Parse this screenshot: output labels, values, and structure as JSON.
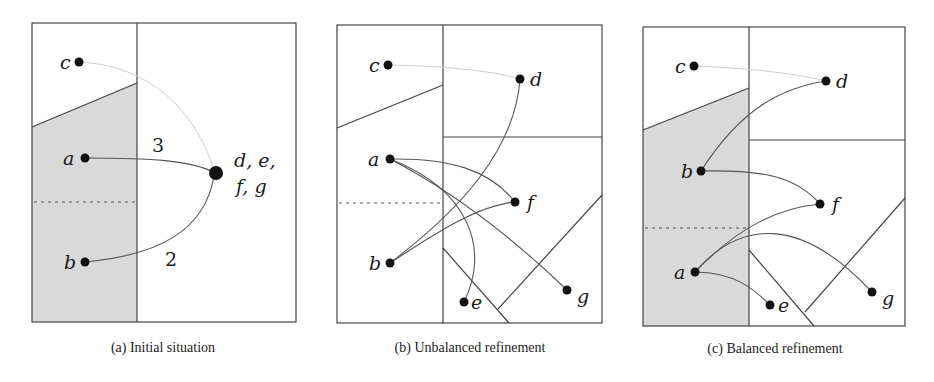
{
  "figure": {
    "panels": [
      {
        "id": "a",
        "caption": "(a)  Initial situation",
        "nodes": {
          "c": "c",
          "a": "a",
          "b": "b",
          "merged": "d, e,",
          "merged2": "f, g"
        },
        "edge_weights": {
          "a_to_merged": "3",
          "b_to_merged": "2"
        }
      },
      {
        "id": "b",
        "caption": "(b)  Unbalanced refinement",
        "nodes": {
          "c": "c",
          "d": "d",
          "a": "a",
          "f": "f",
          "b": "b",
          "e": "e",
          "g": "g"
        }
      },
      {
        "id": "c",
        "caption": "(c)  Balanced refinement",
        "nodes": {
          "c": "c",
          "d": "d",
          "b": "b",
          "f": "f",
          "a": "a",
          "e": "e",
          "g": "g"
        }
      }
    ],
    "colors": {
      "shade": "#d9d9d9",
      "line": "#444444",
      "dot": "#111111"
    }
  }
}
